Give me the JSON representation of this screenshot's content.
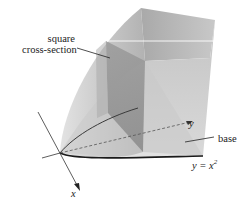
{
  "figure": {
    "labels": {
      "cross_section_line1": "square",
      "cross_section_line2": "cross-section",
      "base": "base",
      "curve_eq_lhs": "y = x",
      "curve_eq_exp": "2",
      "x_axis": "x",
      "y_axis": "y"
    },
    "colors": {
      "solid_light": "#d8d8d8",
      "solid_mid": "#b9b9b9",
      "solid_dark": "#9e9e9e",
      "cross_section": "#8f8f8f",
      "curve": "#1a1a1a",
      "axis": "#333333"
    }
  }
}
